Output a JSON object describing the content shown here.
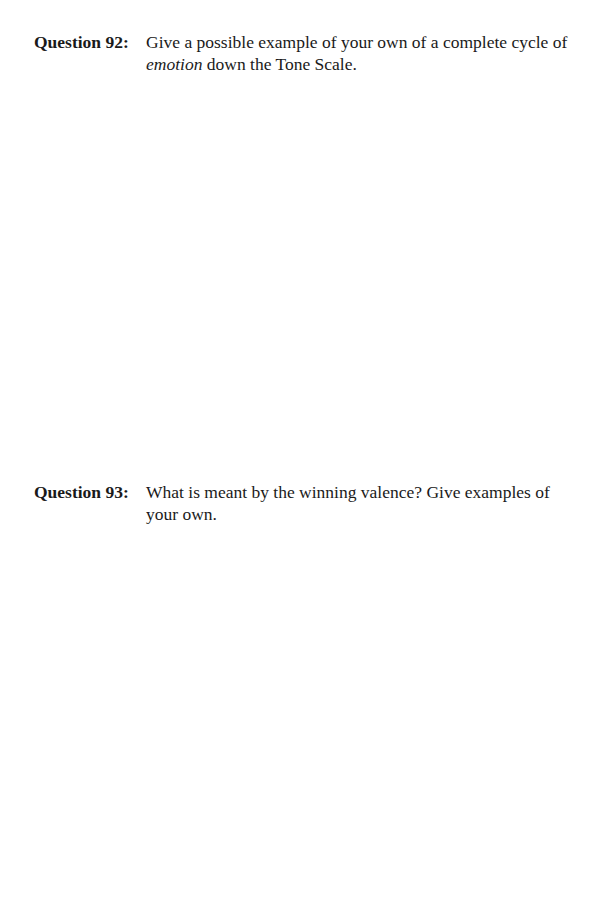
{
  "questions": [
    {
      "label": "Question 92:",
      "text_before_italic": "Give a possible example of your own of a complete cycle of ",
      "text_italic": "emotion",
      "text_after_italic": " down the Tone Scale."
    },
    {
      "label": "Question 93:",
      "text": "What is meant by the winning valence? Give examples of your own."
    }
  ]
}
